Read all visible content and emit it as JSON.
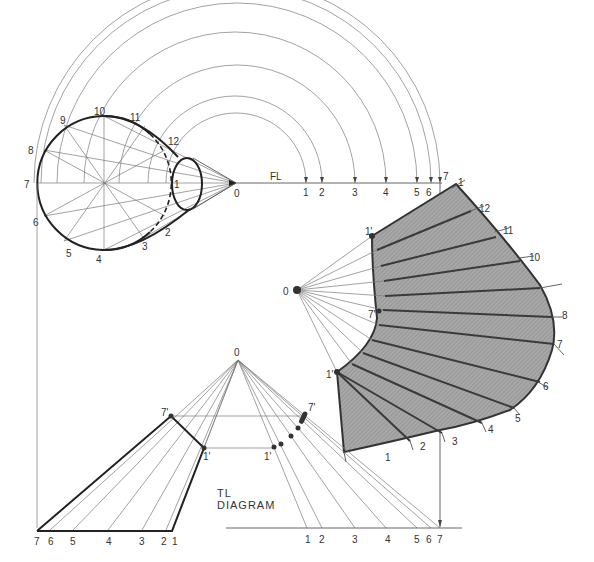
{
  "diagram": {
    "labels": {
      "apex": "0",
      "frontal_line": "FL",
      "tl_diagram_line1": "TL",
      "tl_diagram_line2": "DIAGRAM",
      "base_points": [
        "1",
        "2",
        "3",
        "4",
        "5",
        "6",
        "7",
        "8",
        "9",
        "10",
        "11",
        "12"
      ],
      "fl_points": [
        "1",
        "2",
        "3",
        "4",
        "5",
        "6",
        "7"
      ],
      "tl_bottom_left_points": [
        "7",
        "6",
        "5",
        "4",
        "3",
        "2",
        "1"
      ],
      "tl_bottom_right_points": [
        "1",
        "2",
        "3",
        "4",
        "5",
        "6",
        "7"
      ],
      "truncation_points": [
        "1'",
        "7'"
      ],
      "pattern_outer_points": [
        "1",
        "12",
        "11",
        "10",
        "9",
        "8",
        "7",
        "6",
        "5",
        "4",
        "3",
        "2",
        "1"
      ],
      "pattern_inner_points": [
        "1'",
        "7'",
        "1'"
      ]
    },
    "colors": {
      "line": "#333333",
      "construction": "#7a7a7a",
      "pattern_fill": "#9a9a9a",
      "background": "#ffffff"
    }
  }
}
